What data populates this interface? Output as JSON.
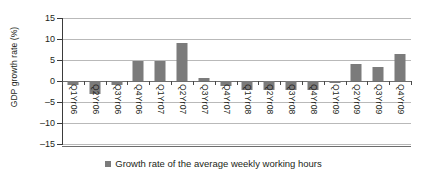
{
  "chart_data": {
    "type": "bar",
    "title": "",
    "subtitle": "",
    "xlabel": "",
    "ylabel": "GDP growth rate (%)",
    "ylim": [
      -15,
      15
    ],
    "yticks": [
      15,
      10,
      5,
      0,
      -5,
      -10,
      -15
    ],
    "ytick_labels": [
      "15",
      "10",
      "5",
      "0",
      "–5",
      "–10",
      "–15"
    ],
    "grid": true,
    "legend_position": "bottom",
    "bar_color": "#7b7b7b",
    "grid_color": "#b9b9b9",
    "axis_color": "#3b3b3b",
    "categories": [
      "Q1Yr06",
      "Q2Yr06",
      "Q3Yr06",
      "Q4Yr06",
      "Q1Yr07",
      "Q2Yr07",
      "Q3Yr07",
      "Q4Yr07",
      "Q1Yr08",
      "Q2Yr08",
      "Q3Yr08",
      "Q4Yr08",
      "Q1Yr09",
      "Q2Yr09",
      "Q3Yr09",
      "Q4Yr09"
    ],
    "series": [
      {
        "name": "Growth rate of the average weekly working hours",
        "values": [
          -1.0,
          -3.0,
          -1.0,
          4.8,
          4.8,
          9.0,
          0.7,
          -1.2,
          -2.2,
          -2.2,
          -2.2,
          -2.2,
          -0.4,
          4.0,
          3.4,
          6.5
        ]
      }
    ]
  },
  "legend": {
    "entries": [
      {
        "label": "Growth rate of the average weekly working hours",
        "color": "#7b7b7b"
      }
    ]
  }
}
